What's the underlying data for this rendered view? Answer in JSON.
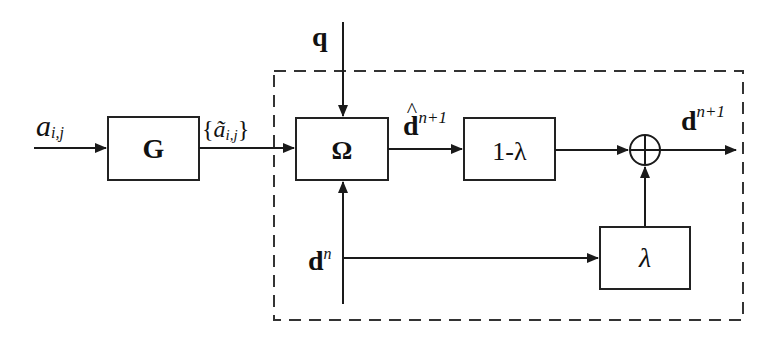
{
  "diagram": {
    "type": "block-diagram",
    "colors": {
      "stroke": "#1a1a1a",
      "background": "#ffffff"
    },
    "inputs": {
      "a": {
        "base": "a",
        "sub": "i,j"
      },
      "q": {
        "label": "q"
      },
      "dn": {
        "base": "d",
        "sup": "n"
      }
    },
    "blocks": {
      "G": {
        "label": "G"
      },
      "Omega": {
        "label": "Ω"
      },
      "one_minus_lambda": {
        "label": "1-λ"
      },
      "lambda": {
        "label": "λ"
      },
      "sum": {
        "symbol": "⊕"
      }
    },
    "signals": {
      "a_tilde": {
        "open": "{",
        "base": "ã",
        "sub": "i,j",
        "close": "}"
      },
      "d_hat": {
        "hat": "^",
        "base": "d",
        "sup": "n+1"
      },
      "d_out": {
        "base": "d",
        "sup": "n+1"
      }
    },
    "edges": [
      {
        "from": "a",
        "to": "G"
      },
      {
        "from": "G",
        "to": "Omega",
        "label": "a_tilde"
      },
      {
        "from": "q",
        "to": "Omega"
      },
      {
        "from": "dn",
        "to": "Omega"
      },
      {
        "from": "Omega",
        "to": "one_minus_lambda",
        "label": "d_hat"
      },
      {
        "from": "one_minus_lambda",
        "to": "sum"
      },
      {
        "from": "dn",
        "to": "lambda"
      },
      {
        "from": "lambda",
        "to": "sum"
      },
      {
        "from": "sum",
        "to": "output",
        "label": "d_out"
      }
    ],
    "group": {
      "style": "dashed",
      "contains": [
        "Omega",
        "one_minus_lambda",
        "lambda",
        "sum"
      ]
    }
  }
}
